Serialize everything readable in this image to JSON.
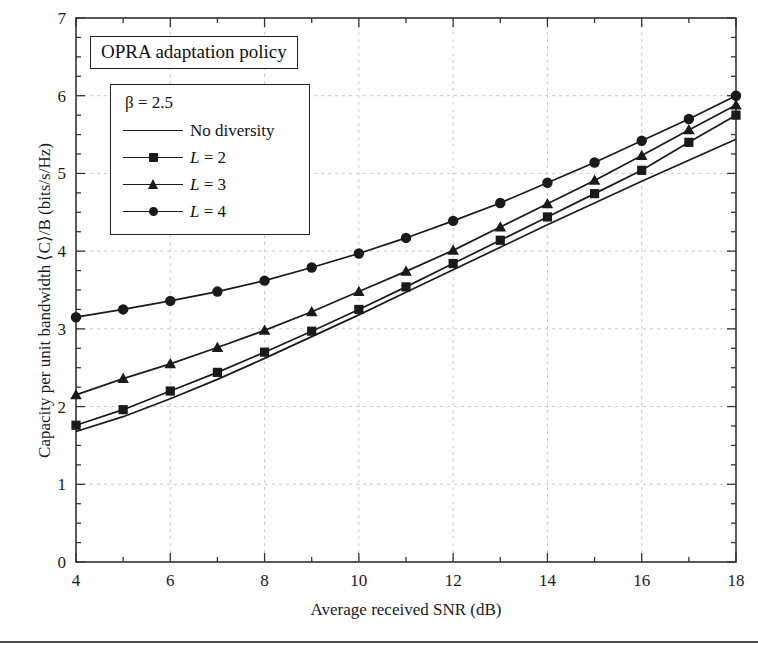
{
  "chart_data": {
    "type": "line",
    "title": "OPRA adaptation policy",
    "xlabel": "Average received SNR (dB)",
    "ylabel": "Capacity per unit bandwidth ⟨C⟩/B (bits/s/Hz)",
    "xlim": [
      4,
      18
    ],
    "ylim": [
      0,
      7
    ],
    "xticks": [
      4,
      6,
      8,
      10,
      12,
      14,
      16,
      18
    ],
    "yticks": [
      0,
      1,
      2,
      3,
      4,
      5,
      6,
      7
    ],
    "xtick_labels": [
      "4",
      "6",
      "8",
      "10",
      "12",
      "14",
      "16",
      "18"
    ],
    "ytick_labels": [
      "0",
      "1",
      "2",
      "3",
      "4",
      "5",
      "6",
      "7"
    ],
    "minor_tick_step_x": 1,
    "minor_tick_step_y": 0.25,
    "grid": "dashed, light gray, at major ticks",
    "legend_position": "upper left, inside, boxed",
    "annotation": "β = 2.5",
    "x": [
      4,
      5,
      6,
      7,
      8,
      9,
      10,
      11,
      12,
      13,
      14,
      15,
      16,
      17,
      18
    ],
    "series": [
      {
        "name": "No diversity",
        "marker": "none",
        "values": [
          1.68,
          1.87,
          2.1,
          2.35,
          2.62,
          2.9,
          3.18,
          3.47,
          3.76,
          4.05,
          4.34,
          4.62,
          4.9,
          5.17,
          5.44
        ]
      },
      {
        "name": "L = 2",
        "marker": "square",
        "values": [
          1.76,
          1.96,
          2.2,
          2.44,
          2.7,
          2.97,
          3.25,
          3.54,
          3.84,
          4.14,
          4.44,
          4.74,
          5.04,
          5.4,
          5.75
        ]
      },
      {
        "name": "L = 3",
        "marker": "triangle",
        "values": [
          2.15,
          2.36,
          2.55,
          2.76,
          2.98,
          3.22,
          3.48,
          3.74,
          4.01,
          4.31,
          4.61,
          4.91,
          5.23,
          5.56,
          5.88
        ]
      },
      {
        "name": "L = 4",
        "marker": "circle",
        "values": [
          3.15,
          3.25,
          3.36,
          3.48,
          3.62,
          3.79,
          3.97,
          4.17,
          4.39,
          4.62,
          4.88,
          5.14,
          5.42,
          5.7,
          6.0
        ]
      }
    ]
  },
  "legend": {
    "beta_label": "β = 2.5",
    "entries": [
      {
        "label": "No diversity",
        "marker": "none"
      },
      {
        "label_prefix": "L",
        "label_suffix": " = 2",
        "marker": "square"
      },
      {
        "label_prefix": "L",
        "label_suffix": " = 3",
        "marker": "triangle"
      },
      {
        "label_prefix": "L",
        "label_suffix": " = 4",
        "marker": "circle"
      }
    ]
  },
  "colors": {
    "line": "#1a1a1a",
    "grid": "#c9c9c9",
    "axis": "#333333",
    "background": "#ffffff"
  }
}
